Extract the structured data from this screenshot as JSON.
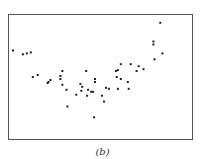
{
  "chart_data": {
    "type": "scatter",
    "title": "",
    "caption": "(b)",
    "xlabel": "",
    "ylabel": "",
    "xlim": [
      0,
      100
    ],
    "ylim": [
      0,
      100
    ],
    "grid": false,
    "legend": null,
    "axes_ticks": false,
    "marker_color": "#222222",
    "points": [
      [
        2.2,
        71.4
      ],
      [
        7.6,
        68.3
      ],
      [
        9.7,
        69.0
      ],
      [
        11.9,
        69.8
      ],
      [
        13.0,
        50.0
      ],
      [
        15.7,
        51.6
      ],
      [
        21.1,
        45.2
      ],
      [
        21.6,
        46.0
      ],
      [
        22.7,
        47.6
      ],
      [
        28.1,
        48.4
      ],
      [
        29.2,
        54.8
      ],
      [
        28.1,
        50.8
      ],
      [
        29.2,
        43.7
      ],
      [
        31.4,
        39.7
      ],
      [
        31.9,
        26.2
      ],
      [
        36.8,
        35.7
      ],
      [
        39.0,
        44.4
      ],
      [
        40.0,
        42.1
      ],
      [
        42.2,
        54.8
      ],
      [
        42.7,
        34.9
      ],
      [
        39.5,
        38.9
      ],
      [
        43.2,
        39.7
      ],
      [
        44.9,
        38.1
      ],
      [
        47.0,
        48.4
      ],
      [
        47.0,
        46.0
      ],
      [
        45.9,
        38.1
      ],
      [
        50.8,
        34.9
      ],
      [
        51.9,
        30.2
      ],
      [
        53.0,
        41.3
      ],
      [
        54.6,
        40.5
      ],
      [
        46.5,
        17.5
      ],
      [
        58.4,
        54.8
      ],
      [
        59.5,
        55.6
      ],
      [
        58.9,
        50.0
      ],
      [
        61.1,
        60.3
      ],
      [
        61.1,
        48.4
      ],
      [
        59.5,
        40.5
      ],
      [
        64.9,
        46.0
      ],
      [
        65.4,
        40.5
      ],
      [
        66.5,
        60.3
      ],
      [
        69.7,
        54.8
      ],
      [
        70.8,
        58.7
      ],
      [
        73.5,
        56.3
      ],
      [
        79.5,
        64.3
      ],
      [
        83.8,
        69.0
      ],
      [
        78.9,
        78.6
      ],
      [
        78.9,
        76.2
      ],
      [
        82.7,
        93.7
      ]
    ]
  }
}
